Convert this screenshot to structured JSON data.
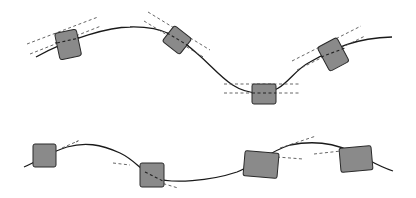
{
  "diagram": {
    "colors": {
      "background": "#ffffff",
      "curve": "#1a1a1a",
      "box_fill": "#8a8a8a",
      "box_stroke": "#2a2a2a",
      "tangent": "#555555"
    },
    "top_curve": {
      "boxes": [
        {
          "id": "top-box-1",
          "cx": 68,
          "cy": 44,
          "angle": -12
        },
        {
          "id": "top-box-2",
          "cx": 177,
          "cy": 40,
          "angle": 38
        },
        {
          "id": "top-box-3",
          "cx": 264,
          "cy": 94,
          "angle": 0
        },
        {
          "id": "top-box-4",
          "cx": 333,
          "cy": 54,
          "angle": -28
        }
      ]
    },
    "bottom_curve": {
      "boxes": [
        {
          "id": "bottom-box-1",
          "cx": 44,
          "cy": 155,
          "angle": 0
        },
        {
          "id": "bottom-box-2",
          "cx": 152,
          "cy": 175,
          "angle": 0
        },
        {
          "id": "bottom-box-3",
          "cx": 261,
          "cy": 165,
          "angle": 5
        },
        {
          "id": "bottom-box-4",
          "cx": 356,
          "cy": 159,
          "angle": -5
        }
      ]
    }
  }
}
